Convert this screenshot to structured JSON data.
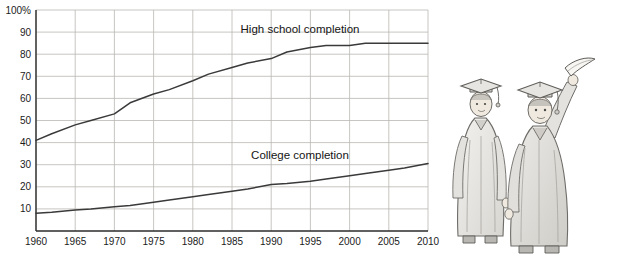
{
  "chart_data": {
    "type": "line",
    "title": "",
    "xlabel": "",
    "ylabel": "",
    "xlim": [
      1960,
      2010
    ],
    "ylim": [
      0,
      100
    ],
    "grid": true,
    "legend_position": "inline-labels",
    "x_ticks": [
      "1960",
      "1965",
      "1970",
      "1975",
      "1980",
      "1985",
      "1990",
      "1995",
      "2000",
      "2005",
      "2010"
    ],
    "y_ticks": [
      "10",
      "20",
      "30",
      "40",
      "50",
      "60",
      "70",
      "80",
      "90",
      "100%"
    ],
    "series": [
      {
        "name": "High school completion",
        "label": "High school completion",
        "color": "#3a3a3a",
        "x": [
          1960,
          1962,
          1965,
          1967,
          1970,
          1972,
          1975,
          1977,
          1980,
          1982,
          1985,
          1987,
          1990,
          1992,
          1995,
          1997,
          2000,
          2002,
          2005,
          2007,
          2010
        ],
        "values": [
          41,
          44,
          48,
          50,
          53,
          58,
          62,
          64,
          68,
          71,
          74,
          76,
          78,
          81,
          83,
          84,
          84,
          85,
          85,
          85,
          85
        ]
      },
      {
        "name": "College completion",
        "label": "College completion",
        "color": "#3a3a3a",
        "x": [
          1960,
          1962,
          1965,
          1967,
          1970,
          1972,
          1975,
          1977,
          1980,
          1982,
          1985,
          1987,
          1990,
          1992,
          1995,
          1997,
          2000,
          2002,
          2005,
          2007,
          2010
        ],
        "values": [
          8,
          8.5,
          9.5,
          10,
          11,
          11.5,
          13,
          14,
          15.5,
          16.5,
          18,
          19,
          21,
          21.5,
          22.5,
          23.5,
          25,
          26,
          27.5,
          28.5,
          30.5
        ]
      }
    ]
  },
  "illustration": {
    "name": "two-graduates-illustration",
    "description": "Two graduates in caps and gowns holding hands, one holding a diploma aloft"
  }
}
